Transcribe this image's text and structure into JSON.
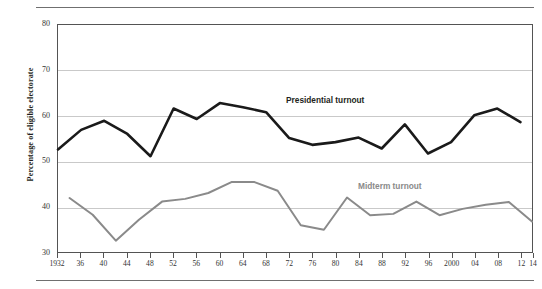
{
  "chart_data": {
    "type": "line",
    "title": "",
    "xlabel": "",
    "ylabel": "Percentage of eligible electorate",
    "ylim": [
      30,
      80
    ],
    "yticks": [
      30,
      40,
      50,
      60,
      70,
      80
    ],
    "grid": true,
    "legend_position": "inline-annotation",
    "x": [
      1932,
      1934,
      1936,
      1938,
      1940,
      1942,
      1944,
      1946,
      1948,
      1950,
      1952,
      1954,
      1956,
      1958,
      1960,
      1962,
      1964,
      1966,
      1968,
      1970,
      1972,
      1974,
      1976,
      1978,
      1980,
      1982,
      1984,
      1986,
      1988,
      1990,
      1992,
      1994,
      1996,
      1998,
      2000,
      2002,
      2004,
      2006,
      2008,
      2010,
      2012,
      2014
    ],
    "xtick_labels": [
      "1932",
      "36",
      "40",
      "44",
      "48",
      "52",
      "56",
      "60",
      "64",
      "68",
      "72",
      "76",
      "80",
      "84",
      "88",
      "92",
      "96",
      "2000",
      "04",
      "08",
      "12",
      "14"
    ],
    "xtick_values": [
      1932,
      1936,
      1940,
      1944,
      1948,
      1952,
      1956,
      1960,
      1964,
      1968,
      1972,
      1976,
      1980,
      1984,
      1988,
      1992,
      1996,
      2000,
      2004,
      2008,
      2012,
      2014
    ],
    "series": [
      {
        "name": "Presidential turnout",
        "color": "#1a1a1a",
        "label_color": "#231f20",
        "x": [
          1932,
          1936,
          1940,
          1944,
          1948,
          1952,
          1956,
          1960,
          1964,
          1968,
          1972,
          1976,
          1980,
          1984,
          1988,
          1992,
          1996,
          2000,
          2004,
          2008,
          2012
        ],
        "values": [
          52.6,
          56.9,
          58.9,
          56.0,
          51.1,
          61.6,
          59.3,
          62.8,
          61.9,
          60.8,
          55.1,
          53.6,
          54.2,
          55.2,
          52.8,
          58.1,
          51.7,
          54.2,
          60.1,
          61.6,
          58.6
        ]
      },
      {
        "name": "Midterm turnout",
        "color": "#8a8a8a",
        "label_color": "#8a8a8a",
        "x": [
          1934,
          1938,
          1942,
          1946,
          1950,
          1954,
          1958,
          1962,
          1966,
          1970,
          1974,
          1978,
          1982,
          1986,
          1990,
          1994,
          1998,
          2002,
          2006,
          2010,
          2014
        ],
        "values": [
          41.9,
          38.2,
          32.5,
          37.1,
          41.1,
          41.7,
          43.0,
          45.4,
          45.4,
          43.5,
          35.9,
          34.9,
          42.0,
          38.1,
          38.4,
          41.1,
          38.1,
          39.5,
          40.4,
          41.0,
          36.7
        ]
      }
    ]
  },
  "annotations": [
    {
      "text": "Presidential turnout"
    },
    {
      "text": "Midterm turnout"
    }
  ]
}
